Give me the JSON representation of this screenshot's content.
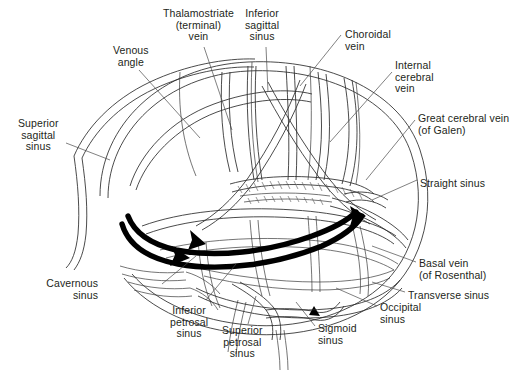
{
  "figure": {
    "type": "anatomical-line-diagram",
    "background_color": "#ffffff",
    "ink_color": "#231f20",
    "highlight_color": "#000000"
  },
  "labels": [
    {
      "id": "superior-sagittal-sinus",
      "text": "Superior\nsagittal\nsinus",
      "align": "center",
      "x": 18,
      "y": 118
    },
    {
      "id": "venous-angle",
      "text": "Venous\nangle",
      "align": "center",
      "x": 113,
      "y": 45
    },
    {
      "id": "thalamostriate-vein",
      "text": "Thalamostriate\n(terminal)\nvein",
      "align": "center",
      "x": 163,
      "y": 8
    },
    {
      "id": "inferior-sagittal-sinus",
      "text": "Inferior\nsagittal\nsinus",
      "align": "center",
      "x": 245,
      "y": 8
    },
    {
      "id": "choroidal-vein",
      "text": "Choroidal\nvein",
      "align": "left",
      "x": 345,
      "y": 29
    },
    {
      "id": "internal-cerebral-vein",
      "text": "Internal\ncerebral\nvein",
      "align": "left",
      "x": 395,
      "y": 60
    },
    {
      "id": "great-cerebral-vein",
      "text": "Great cerebral vein\n(of Galen)",
      "align": "left",
      "x": 418,
      "y": 113
    },
    {
      "id": "straight-sinus",
      "text": "Straight sinus",
      "align": "left",
      "x": 420,
      "y": 178
    },
    {
      "id": "basal-vein",
      "text": "Basal vein\n(of Rosenthal)",
      "align": "left",
      "x": 419,
      "y": 258
    },
    {
      "id": "transverse-sinus",
      "text": "Transverse sinus",
      "align": "left",
      "x": 408,
      "y": 290
    },
    {
      "id": "occipital-sinus",
      "text": "Occipital\nsinus",
      "align": "left",
      "x": 380,
      "y": 302
    },
    {
      "id": "sigmoid-sinus",
      "text": "Sigmoid\nsinus",
      "align": "left",
      "x": 318,
      "y": 323
    },
    {
      "id": "superior-petrosal-sinus",
      "text": "Superior\npetrosal\nsinus",
      "align": "center",
      "x": 222,
      "y": 325
    },
    {
      "id": "inferior-petrosal-sinus",
      "text": "Inferior\npetrosal\nsinus",
      "align": "center",
      "x": 170,
      "y": 305
    },
    {
      "id": "cavernous-sinus",
      "text": "Cavernous\nsinus",
      "align": "right",
      "x": 98,
      "y": 278
    }
  ]
}
